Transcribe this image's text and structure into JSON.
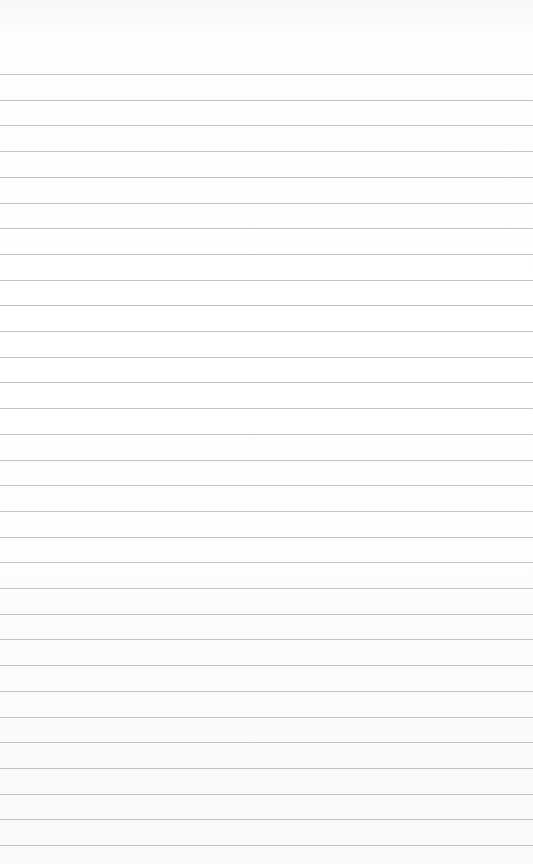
{
  "paper": {
    "type": "lined-paper",
    "rule_count": 31,
    "first_rule_y": 74,
    "rule_spacing": 25.7,
    "rule_color": "#b8b8b8",
    "background": "#ffffff"
  }
}
